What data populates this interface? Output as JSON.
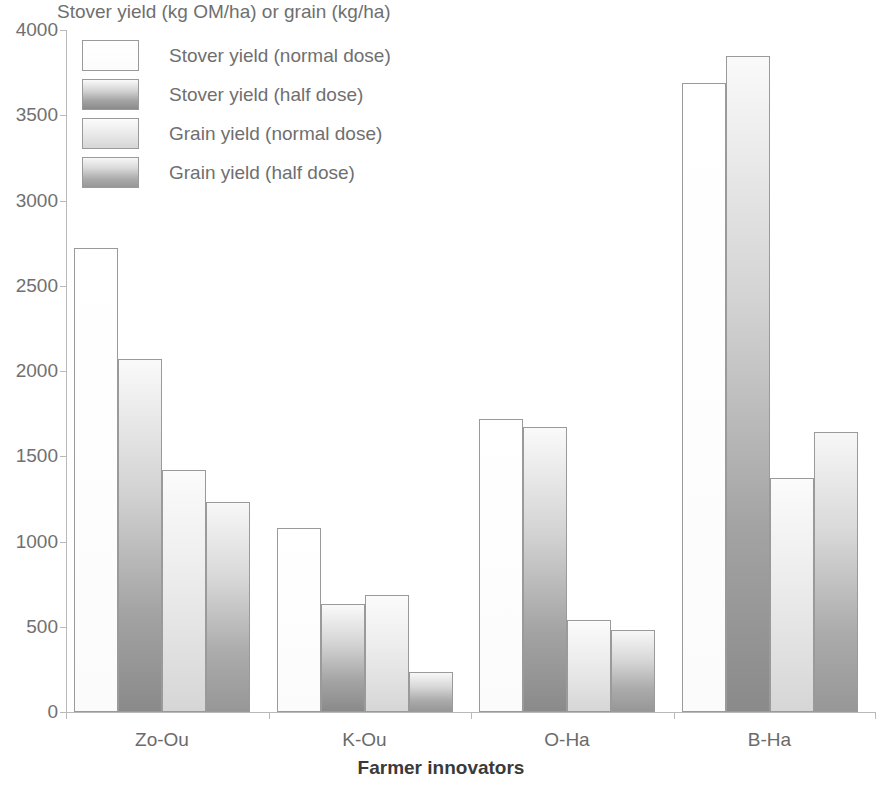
{
  "chart_data": {
    "type": "bar",
    "title": "Stover yield (kg OM/ha) or grain (kg/ha)",
    "xlabel": "Farmer innovators",
    "ylabel": "",
    "categories": [
      "Zo-Ou",
      "K-Ou",
      "O-Ha",
      "B-Ha"
    ],
    "series": [
      {
        "name": "Stover yield (normal dose)",
        "values": [
          2720,
          1080,
          1720,
          3690
        ],
        "color": "#ffffff"
      },
      {
        "name": "Stover yield (half dose)",
        "values": [
          2070,
          635,
          1670,
          3845
        ],
        "color": "#8a8a8a"
      },
      {
        "name": "Grain yield (normal dose)",
        "values": [
          1420,
          685,
          540,
          1370
        ],
        "color": "#d6d6d6"
      },
      {
        "name": "Grain yield (half dose)",
        "values": [
          1230,
          235,
          480,
          1640
        ],
        "color": "#979797"
      }
    ],
    "ylim": [
      0,
      4000
    ],
    "yticks": [
      0,
      500,
      1000,
      1500,
      2000,
      2500,
      3000,
      3500,
      4000
    ],
    "ytick_labels": [
      "0",
      "500",
      "1000",
      "1500",
      "2000",
      "2500",
      "3000",
      "3500",
      "4000"
    ],
    "grid": false,
    "legend_position": "upper-left-inside"
  }
}
